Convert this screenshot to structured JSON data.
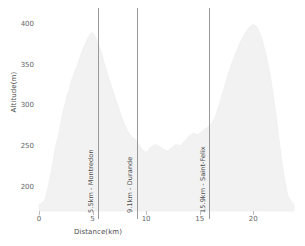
{
  "chart_data": {
    "type": "area",
    "title": "",
    "xlabel": "Distance(km)",
    "ylabel": "Altitude(m)",
    "xlim": [
      0,
      23.8
    ],
    "ylim": [
      170,
      420
    ],
    "grid": false,
    "legend": null,
    "xticks": [
      0,
      5,
      10,
      15,
      20
    ],
    "yticks": [
      200,
      250,
      300,
      350,
      400
    ],
    "series": [
      {
        "name": "Elevation profile",
        "fill_color": "#f2f2f2",
        "line_color": "#ebebeb",
        "x": [
          0.0,
          0.2,
          0.4,
          0.6,
          0.8,
          1.0,
          1.2,
          1.4,
          1.6,
          1.8,
          2.0,
          2.2,
          2.4,
          2.6,
          2.8,
          3.0,
          3.2,
          3.4,
          3.6,
          3.8,
          4.0,
          4.2,
          4.4,
          4.6,
          4.8,
          5.0,
          5.2,
          5.4,
          5.6,
          5.8,
          6.0,
          6.2,
          6.4,
          6.6,
          6.8,
          7.0,
          7.2,
          7.4,
          7.6,
          7.8,
          8.0,
          8.2,
          8.4,
          8.6,
          8.8,
          9.0,
          9.2,
          9.4,
          9.6,
          9.8,
          10.0,
          10.4,
          10.8,
          11.2,
          11.6,
          12.0,
          12.4,
          12.8,
          13.2,
          13.6,
          14.0,
          14.4,
          14.8,
          15.2,
          15.6,
          16.0,
          16.4,
          16.8,
          17.2,
          17.6,
          18.0,
          18.4,
          18.8,
          19.2,
          19.6,
          20.0,
          20.4,
          20.8,
          21.2,
          21.6,
          22.0,
          22.4,
          22.8,
          23.2,
          23.6,
          23.8
        ],
        "y": [
          178,
          179,
          181,
          186,
          196,
          210,
          222,
          238,
          252,
          262,
          276,
          290,
          300,
          312,
          318,
          330,
          336,
          344,
          350,
          358,
          366,
          372,
          378,
          384,
          388,
          390,
          386,
          380,
          374,
          366,
          356,
          348,
          338,
          330,
          322,
          314,
          306,
          298,
          290,
          282,
          276,
          270,
          266,
          262,
          260,
          258,
          254,
          250,
          246,
          244,
          242,
          248,
          252,
          250,
          246,
          244,
          248,
          252,
          250,
          256,
          262,
          266,
          264,
          268,
          272,
          276,
          284,
          300,
          318,
          336,
          352,
          366,
          378,
          388,
          396,
          400,
          396,
          382,
          362,
          336,
          300,
          258,
          218,
          190,
          180,
          178
        ]
      }
    ],
    "annotations": [
      {
        "x": 5.5,
        "label": "5.5km - Montredon"
      },
      {
        "x": 9.1,
        "label": "9.1km - Durande"
      },
      {
        "x": 15.9,
        "label": "15.9km - Saint-Felix"
      }
    ]
  }
}
